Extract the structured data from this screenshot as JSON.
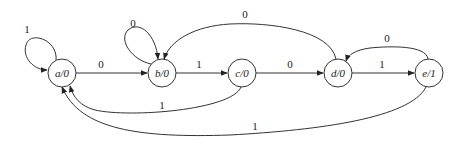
{
  "diagram": {
    "type": "state-machine (Moore)",
    "states": [
      {
        "id": "a",
        "label": "a/0",
        "output": "0"
      },
      {
        "id": "b",
        "label": "b/0",
        "output": "0"
      },
      {
        "id": "c",
        "label": "c/0",
        "output": "0"
      },
      {
        "id": "d",
        "label": "d/0",
        "output": "0"
      },
      {
        "id": "e",
        "label": "e/1",
        "output": "1"
      }
    ],
    "transitions": [
      {
        "from": "a",
        "to": "a",
        "input": "1"
      },
      {
        "from": "a",
        "to": "b",
        "input": "0"
      },
      {
        "from": "b",
        "to": "b",
        "input": "0"
      },
      {
        "from": "b",
        "to": "c",
        "input": "1"
      },
      {
        "from": "c",
        "to": "d",
        "input": "0"
      },
      {
        "from": "c",
        "to": "a",
        "input": "1"
      },
      {
        "from": "d",
        "to": "e",
        "input": "1"
      },
      {
        "from": "d",
        "to": "b",
        "input": "0"
      },
      {
        "from": "e",
        "to": "d",
        "input": "0"
      },
      {
        "from": "e",
        "to": "a",
        "input": "1"
      }
    ]
  }
}
